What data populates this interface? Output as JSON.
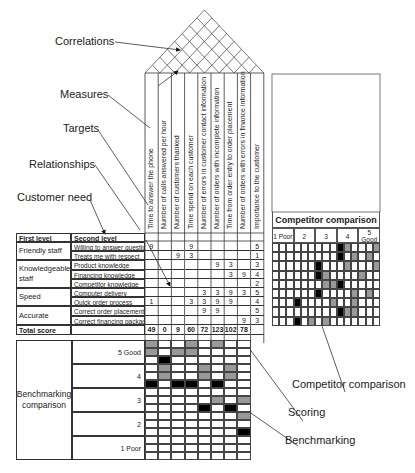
{
  "callouts": {
    "correlations": "Correlations",
    "measures": "Measures",
    "targets": "Targets",
    "relationships": "Relationships",
    "customer_need": "Customer need",
    "competitor_comparison": "Competitor comparison",
    "scoring": "Scoring",
    "benchmarking": "Benchmarking"
  },
  "measures": [
    "Time to answer the phone",
    "Number of calls answered per hour",
    "Number of customers thanked",
    "Time spend on each customer",
    "Number of errors in customer contact information",
    "Number of orders with incomplete information",
    "Time from order entry to order placement",
    "Number of orders with errors in finance information",
    "Importance to the customer"
  ],
  "table": {
    "header_first": "First level",
    "header_second": "Second level",
    "groups": [
      {
        "first": "Friendly staff",
        "rows": [
          0,
          1
        ]
      },
      {
        "first": "Knowledgeable staff",
        "rows": [
          2,
          3,
          4
        ]
      },
      {
        "first": "Speed",
        "rows": [
          5,
          6
        ]
      },
      {
        "first": "Accurate",
        "rows": [
          7,
          8
        ]
      }
    ],
    "rows": [
      {
        "second": "Willing to answer questions",
        "values": [
          "9",
          "",
          "",
          "9",
          "",
          "",
          "",
          "",
          "5"
        ]
      },
      {
        "second": "Treats me with respect",
        "values": [
          "",
          "",
          "9",
          "3",
          "",
          "",
          "",
          "",
          "1"
        ]
      },
      {
        "second": "Product knowledge",
        "values": [
          "",
          "",
          "",
          "",
          "",
          "9",
          "3",
          "",
          "3"
        ]
      },
      {
        "second": "Financing knowledge",
        "values": [
          "",
          "",
          "",
          "",
          "",
          "",
          "3",
          "9",
          "4"
        ]
      },
      {
        "second": "Competitor knowledge",
        "values": [
          "",
          "",
          "",
          "",
          "",
          "",
          "",
          "",
          "2"
        ]
      },
      {
        "second": "Computer delivery",
        "values": [
          "",
          "",
          "",
          "",
          "3",
          "3",
          "9",
          "3",
          "5"
        ]
      },
      {
        "second": "Quick order process",
        "values": [
          "1",
          "",
          "",
          "3",
          "3",
          "9",
          "9",
          "",
          "4"
        ]
      },
      {
        "second": "Correct order placement",
        "values": [
          "",
          "",
          "",
          "",
          "9",
          "9",
          "",
          "",
          "5"
        ]
      },
      {
        "second": "Correct financing package",
        "values": [
          "",
          "",
          "",
          "",
          "",
          "",
          "",
          "9",
          "3"
        ]
      }
    ],
    "total_label": "Total score",
    "totals": [
      "49",
      "0",
      "9",
      "60",
      "72",
      "123",
      "102",
      "78",
      ""
    ]
  },
  "competitor": {
    "title": "Competitor comparison",
    "scale": [
      "1 Poor",
      "2",
      "3",
      "4",
      "5 Good"
    ],
    "cols": 15,
    "rows": [
      {
        "black": [
          9
        ],
        "gray": [
          10,
          14
        ]
      },
      {
        "black": [
          9
        ],
        "gray": [
          11,
          13
        ]
      },
      {
        "black": [
          6
        ],
        "gray": [
          10,
          14
        ]
      },
      {
        "black": [
          6
        ],
        "gray": [
          7,
          12
        ]
      },
      {
        "black": [
          9
        ],
        "gray": [
          7,
          8
        ]
      },
      {
        "black": [
          6
        ],
        "gray": [
          11,
          13
        ]
      },
      {
        "black": [
          3
        ],
        "gray": [
          8,
          11
        ]
      },
      {
        "black": [
          9
        ],
        "gray": [
          10,
          11
        ]
      },
      {
        "black": [
          3
        ],
        "gray": [
          5,
          7
        ]
      }
    ]
  },
  "benchmarking": {
    "label": "Benchmarking comparison",
    "scale": [
      "5 Good",
      "4",
      "3",
      "2",
      "1 Poor"
    ],
    "cols": 8,
    "rows_per_level": 3,
    "cells": [
      {
        "r": 0,
        "gray": [
          0,
          3,
          5
        ]
      },
      {
        "r": 1,
        "gray": [
          0,
          2,
          3
        ]
      },
      {
        "r": 2,
        "black": [
          1
        ]
      },
      {
        "r": 3,
        "gray": [
          1,
          4,
          6
        ]
      },
      {
        "r": 4,
        "gray": [
          1,
          4,
          6
        ]
      },
      {
        "r": 5,
        "black": [
          0,
          2,
          3,
          5
        ]
      },
      {
        "r": 7,
        "gray": [
          5,
          7
        ]
      },
      {
        "r": 8,
        "black": [
          4,
          6
        ]
      },
      {
        "r": 9,
        "gray": [
          7
        ]
      },
      {
        "r": 11,
        "black": [
          7
        ]
      }
    ]
  }
}
